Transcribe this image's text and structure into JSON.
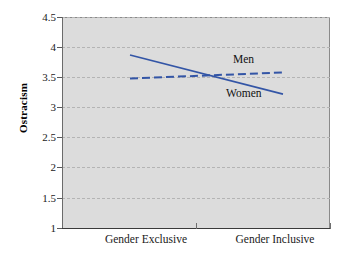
{
  "chart_data": {
    "type": "line",
    "title": "",
    "xlabel": "",
    "ylabel": "Ostracism",
    "categories": [
      "Gender Exclusive",
      "Gender Inclusive"
    ],
    "x": [
      0,
      1
    ],
    "ylim": [
      1,
      4.5
    ],
    "xlim": [
      -0.5,
      1.5
    ],
    "yticks": [
      1,
      1.5,
      2,
      2.5,
      3,
      3.5,
      4,
      4.5
    ],
    "ytick_labels": [
      "1",
      "1.5",
      "2",
      "2.5",
      "3",
      "3.5",
      "4",
      "4.5"
    ],
    "grid": true,
    "grid_style": "dashed",
    "legend_position": "inline-annotations",
    "plot_background": "#dcdcdc",
    "series": [
      {
        "name": "Men",
        "values": [
          3.48,
          3.58
        ],
        "style": "dashed",
        "color": "#3355a6",
        "label_text": "Men"
      },
      {
        "name": "Women",
        "values": [
          3.87,
          3.22
        ],
        "style": "solid",
        "color": "#3355a6",
        "label_text": "Women"
      }
    ]
  },
  "axis": {
    "y_title": "Ostracism",
    "y_ticks": [
      {
        "value": 4.5,
        "label": "4.5"
      },
      {
        "value": 4,
        "label": "4"
      },
      {
        "value": 3.5,
        "label": "3.5"
      },
      {
        "value": 3,
        "label": "3"
      },
      {
        "value": 2.5,
        "label": "2.5"
      },
      {
        "value": 2,
        "label": "2"
      },
      {
        "value": 1.5,
        "label": "1.5"
      },
      {
        "value": 1,
        "label": "1"
      }
    ],
    "x_ticks": [
      {
        "label": "Gender Exclusive"
      },
      {
        "label": "Gender Inclusive"
      }
    ]
  },
  "colors": {
    "series_blue": "#3355a6",
    "plot_bg": "#dcdcdc",
    "gridline": "#b4b4b4",
    "axis": "#3a3a3a",
    "text": "#1a1a1a",
    "page_bg": "#ffffff"
  }
}
